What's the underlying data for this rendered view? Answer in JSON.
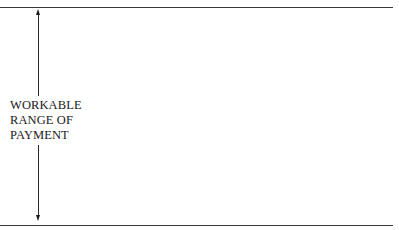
{
  "diagram": {
    "label_lines": [
      "WORKABLE",
      "RANGE OF",
      "PAYMENT"
    ],
    "arrow": "double-headed vertical arrow",
    "line_color": "#3a3a3a"
  }
}
